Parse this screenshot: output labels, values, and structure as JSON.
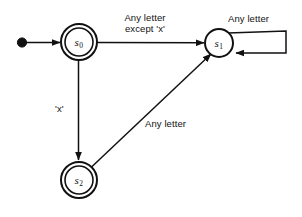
{
  "diagram": {
    "type": "finite-state-machine",
    "title": "",
    "canvas": {
      "width": 302,
      "height": 217,
      "background": "#ffffff"
    },
    "stroke_color": "#111111",
    "states": [
      {
        "id": "s0",
        "label": "s",
        "subscript": "0",
        "accepting": true,
        "start": true,
        "cx": 79,
        "cy": 42,
        "r_outer": 18,
        "r_inner": 14
      },
      {
        "id": "s1",
        "label": "s",
        "subscript": "1",
        "accepting": false,
        "start": false,
        "cx": 219,
        "cy": 43,
        "r_outer": 14,
        "r_inner": 0
      },
      {
        "id": "s2",
        "label": "s",
        "subscript": "2",
        "accepting": true,
        "start": false,
        "cx": 79,
        "cy": 180,
        "r_outer": 18,
        "r_inner": 14
      }
    ],
    "transitions": [
      {
        "id": "start-arrow",
        "from": "",
        "to": "s0",
        "label": "",
        "shape": "start-marker"
      },
      {
        "id": "s0-to-s1",
        "from": "s0",
        "to": "s1",
        "label_line1": "Any letter",
        "label_line2": "except 'x'",
        "shape": "horizontal"
      },
      {
        "id": "s1-self-loop",
        "from": "s1",
        "to": "s1",
        "label_line1": "Any letter",
        "label_line2": "",
        "shape": "rectangular-self-loop"
      },
      {
        "id": "s0-to-s2",
        "from": "s0",
        "to": "s2",
        "label_line1": "'x'",
        "label_line2": "",
        "shape": "vertical"
      },
      {
        "id": "s2-to-s1",
        "from": "s2",
        "to": "s1",
        "label_line1": "Any letter",
        "label_line2": "",
        "shape": "diagonal"
      }
    ]
  }
}
